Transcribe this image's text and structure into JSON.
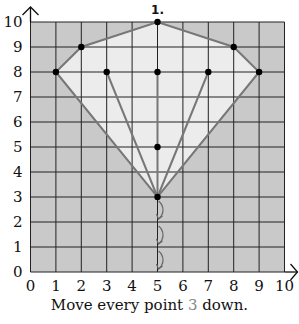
{
  "problem_number": "1.",
  "instruction": {
    "before": "Move every point ",
    "amount": "3",
    "after": " down."
  },
  "grid": {
    "x_min": 0,
    "x_max": 10,
    "y_min": 0,
    "y_max": 10,
    "x_ticks": [
      "0",
      "1",
      "2",
      "3",
      "4",
      "5",
      "6",
      "7",
      "8",
      "9",
      "10"
    ],
    "y_ticks": [
      "0",
      "1",
      "2",
      "3",
      "4",
      "5",
      "6",
      "7",
      "8",
      "9",
      "10"
    ]
  },
  "colors": {
    "outside_fill": "#c9c9c9",
    "inside_fill": "#ececec",
    "grid_line": "#222222",
    "shape_line": "#777777",
    "point": "#000000",
    "highlight_number": "#888888"
  },
  "shape": {
    "outline": [
      [
        1,
        8
      ],
      [
        2,
        9
      ],
      [
        5,
        10
      ],
      [
        8,
        9
      ],
      [
        9,
        8
      ],
      [
        5,
        3
      ]
    ],
    "inner_lines": [
      [
        [
          3,
          8
        ],
        [
          5,
          3
        ]
      ],
      [
        [
          5,
          8
        ],
        [
          5,
          3
        ]
      ],
      [
        [
          7,
          8
        ],
        [
          5,
          3
        ]
      ]
    ],
    "points": [
      [
        5,
        10
      ],
      [
        2,
        9
      ],
      [
        8,
        9
      ],
      [
        1,
        8
      ],
      [
        3,
        8
      ],
      [
        5,
        8
      ],
      [
        7,
        8
      ],
      [
        9,
        8
      ],
      [
        5,
        5
      ],
      [
        5,
        3
      ]
    ]
  },
  "move_arrows": {
    "x": 5,
    "from_y": 3,
    "steps": 3
  }
}
